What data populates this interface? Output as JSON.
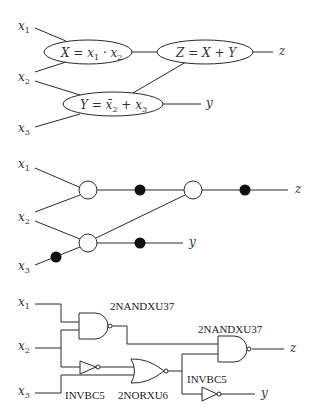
{
  "panel_a": {
    "inputs": [
      {
        "label": "x",
        "sub": "1"
      },
      {
        "label": "x",
        "sub": "2"
      },
      {
        "label": "x",
        "sub": "3"
      }
    ],
    "nodes": {
      "X": {
        "eq_pre": "X = x",
        "sub1": "1",
        "mid": " · x",
        "sub2": "2"
      },
      "Z": {
        "eq": "Z = X + Y"
      },
      "Y": {
        "eq_pre": "Y = x̄",
        "sub1": "2",
        "mid": " + x",
        "sub2": "3"
      }
    },
    "outputs": {
      "z": "z",
      "y": "y"
    }
  },
  "panel_b": {
    "inputs": [
      {
        "label": "x",
        "sub": "1"
      },
      {
        "label": "x",
        "sub": "2"
      },
      {
        "label": "x",
        "sub": "3"
      }
    ],
    "outputs": {
      "z": "z",
      "y": "y"
    }
  },
  "panel_c": {
    "inputs": [
      {
        "label": "x",
        "sub": "1"
      },
      {
        "label": "x",
        "sub": "2"
      },
      {
        "label": "x",
        "sub": "3"
      }
    ],
    "cells": {
      "nand1": "2NANDXU37",
      "nand2": "2NANDXU37",
      "inv1": "INVBC5",
      "nor1": "2NORXU6",
      "inv2": "INVBC5"
    },
    "outputs": {
      "z": "z",
      "y": "y"
    }
  }
}
